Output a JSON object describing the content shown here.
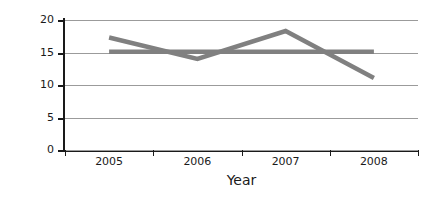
{
  "chart_data": {
    "type": "line",
    "title": "",
    "xlabel": "Year",
    "ylabel": "Percentage",
    "categories": [
      "2005",
      "2006",
      "2007",
      "2008"
    ],
    "x": [
      2005,
      2006,
      2007,
      2008
    ],
    "ylim": [
      0,
      20
    ],
    "yticks": [
      0,
      5,
      10,
      15,
      20
    ],
    "ytick_labels": [
      "0",
      "5",
      "10",
      "15",
      "20"
    ],
    "grid": true,
    "legend": "none",
    "series": [
      {
        "name": "series-1",
        "color": "#808080",
        "values": [
          17.3,
          14.0,
          18.3,
          11.1
        ]
      },
      {
        "name": "series-2",
        "color": "#808080",
        "values": [
          15.1,
          15.1,
          15.1,
          15.1
        ]
      }
    ]
  },
  "axis": {
    "y_title": "Percentage",
    "x_title": "Year"
  },
  "style": {
    "line_color": "#808080",
    "grid_color": "#9b9b9b",
    "axis_color": "#1a1a1a",
    "background": "#ffffff"
  }
}
